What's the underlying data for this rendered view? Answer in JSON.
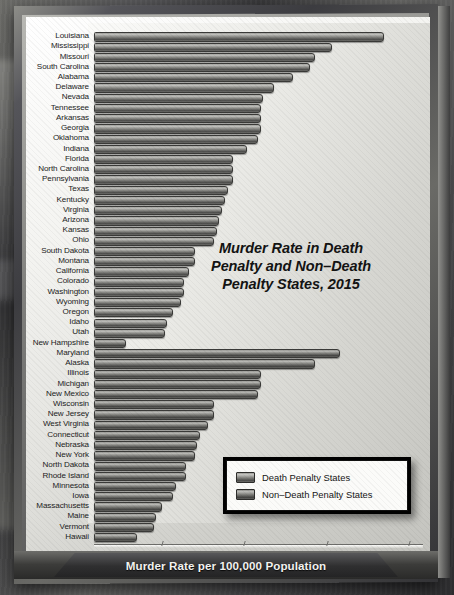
{
  "poster": {
    "title_lines": [
      "Murder Rate in Death",
      "Penalty and Non–Death",
      "Penalty States, 2015"
    ],
    "caption": "Murder Rate per 100,000 Population"
  },
  "legend": {
    "items": [
      {
        "label": "Death Penalty States",
        "group": "dp"
      },
      {
        "label": "Non–Death Penalty States",
        "group": "ndp"
      }
    ]
  },
  "chart_data": {
    "type": "bar",
    "orientation": "horizontal",
    "title": "Murder Rate in Death Penalty and Non–Death Penalty States, 2015",
    "xlabel": "Murder Rate per 100,000 Population",
    "ylabel": "",
    "xlim": [
      0,
      12
    ],
    "xticks": [
      0,
      3,
      6,
      9,
      12
    ],
    "xtick_labels": [
      "0",
      "3",
      "6",
      "9",
      "12"
    ],
    "grid": false,
    "legend_position": "bottom-right",
    "series": [
      {
        "name": "Death Penalty States",
        "color": "#8e8e8a"
      },
      {
        "name": "Non–Death Penalty States",
        "color": "#83837f"
      }
    ],
    "categories": [
      "Louisiana",
      "Mississippi",
      "Missouri",
      "South Carolina",
      "Alabama",
      "Delaware",
      "Nevada",
      "Tennessee",
      "Arkansas",
      "Georgia",
      "Oklahoma",
      "Indiana",
      "Florida",
      "North Carolina",
      "Pennsylvania",
      "Texas",
      "Kentucky",
      "Virginia",
      "Arizona",
      "Kansas",
      "Ohio",
      "South Dakota",
      "Montana",
      "California",
      "Colorado",
      "Washington",
      "Wyoming",
      "Oregon",
      "Idaho",
      "Utah",
      "New Hampshire",
      "Maryland",
      "Alaska",
      "Illinois",
      "Michigan",
      "New Mexico",
      "Wisconsin",
      "New Jersey",
      "West Virginia",
      "Connecticut",
      "Nebraska",
      "New York",
      "North Dakota",
      "Rhode Island",
      "Minnesota",
      "Iowa",
      "Massachusetts",
      "Maine",
      "Vermont",
      "Hawaii"
    ],
    "values": [
      10.5,
      8.6,
      8.0,
      7.8,
      7.2,
      6.5,
      6.1,
      6.0,
      6.0,
      6.0,
      5.9,
      5.5,
      5.0,
      5.0,
      5.0,
      4.8,
      4.7,
      4.6,
      4.5,
      4.4,
      4.3,
      3.6,
      3.6,
      3.4,
      3.2,
      3.2,
      3.1,
      2.8,
      2.6,
      2.5,
      1.1,
      8.9,
      8.0,
      6.0,
      6.0,
      5.9,
      4.3,
      4.3,
      4.1,
      3.8,
      3.7,
      3.6,
      3.3,
      3.3,
      2.9,
      2.8,
      2.4,
      2.2,
      2.1,
      1.5
    ],
    "groups": [
      "dp",
      "dp",
      "dp",
      "dp",
      "dp",
      "dp",
      "dp",
      "dp",
      "dp",
      "dp",
      "dp",
      "dp",
      "dp",
      "dp",
      "dp",
      "dp",
      "dp",
      "dp",
      "dp",
      "dp",
      "dp",
      "dp",
      "dp",
      "dp",
      "dp",
      "dp",
      "dp",
      "dp",
      "dp",
      "dp",
      "ndp",
      "ndp",
      "ndp",
      "ndp",
      "ndp",
      "ndp",
      "ndp",
      "ndp",
      "ndp",
      "ndp",
      "ndp",
      "ndp",
      "ndp",
      "ndp",
      "ndp",
      "ndp",
      "ndp",
      "ndp",
      "ndp",
      "ndp"
    ]
  }
}
